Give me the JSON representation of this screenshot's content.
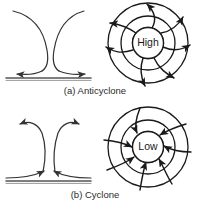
{
  "figure": {
    "background_color": "#ffffff",
    "stroke_color": "#1a1a1a",
    "text_color": "#2b2b2b",
    "panels": [
      {
        "id": "anticyclone",
        "caption": "(a) Anticyclone",
        "cross_section": {
          "name": "vertical-cross-section-anticyclone",
          "description": "descending-air-diverging-at-surface",
          "ground_line": true,
          "surface_arrows": [
            "left",
            "right"
          ],
          "aloft_arrows": []
        },
        "plan_view": {
          "name": "plan-view-anticyclone",
          "center_label": "High",
          "circle_count": 3,
          "spiral_direction": "outward",
          "rotation": "clockwise",
          "arrow_count": 6
        }
      },
      {
        "id": "cyclone",
        "caption": "(b) Cyclone",
        "cross_section": {
          "name": "vertical-cross-section-cyclone",
          "description": "converging-air-at-surface-rising",
          "ground_line": true,
          "surface_arrows": [
            "right",
            "left"
          ],
          "aloft_arrows": [
            "left",
            "right"
          ]
        },
        "plan_view": {
          "name": "plan-view-cyclone",
          "center_label": "Low",
          "circle_count": 3,
          "spiral_direction": "inward",
          "rotation": "counterclockwise",
          "arrow_count": 6
        }
      }
    ]
  }
}
